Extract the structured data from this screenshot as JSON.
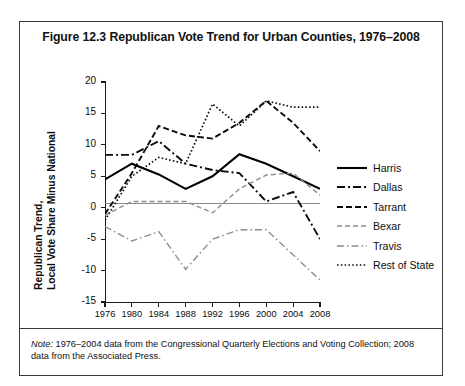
{
  "figure": {
    "title": "Figure 12.3  Republican Vote Trend for Urban Counties, 1976–2008",
    "note_prefix": "Note:",
    "note_text": " 1976–2004 data from the Congressional Quarterly Elections and Voting Collection; 2008 data from the Associated Press."
  },
  "chart_data": {
    "type": "line",
    "title": "Figure 12.3  Republican Vote Trend for Urban Counties, 1976–2008",
    "xlabel": "",
    "ylabel": "Republican Trend, Local Vote Share Minus National",
    "ylabel_line1": "Republican Trend,",
    "ylabel_line2": "Local Vote Share Minus National",
    "x": [
      1976,
      1980,
      1984,
      1988,
      1992,
      1996,
      2000,
      2004,
      2008
    ],
    "xtick_labels": [
      "1976",
      "1980",
      "1984",
      "1988",
      "1992",
      "1996",
      "2000",
      "2004",
      "2008"
    ],
    "ytick_labels": [
      "20",
      "15",
      "10",
      "5",
      "0",
      "-5",
      "-10",
      "-15"
    ],
    "yticks": [
      20,
      15,
      10,
      5,
      0,
      -5,
      -10,
      -15
    ],
    "ylim": [
      -15,
      20
    ],
    "xlim": [
      1976,
      2008
    ],
    "grid": false,
    "zero_line": true,
    "legend_position": "right",
    "series": [
      {
        "name": "Harris",
        "style": "solid",
        "color": "#000000",
        "values": [
          4.5,
          7.0,
          5.3,
          3.0,
          5.0,
          8.5,
          7.0,
          5.0,
          3.0
        ]
      },
      {
        "name": "Dallas",
        "style": "dash-dot",
        "color": "#000000",
        "values": [
          8.4,
          8.4,
          10.6,
          7.0,
          6.0,
          5.5,
          1.0,
          2.5,
          -5.0
        ]
      },
      {
        "name": "Tarrant",
        "style": "dashed",
        "color": "#000000",
        "values": [
          -1.0,
          5.5,
          13.0,
          11.5,
          11.0,
          13.5,
          17.0,
          13.5,
          9.0
        ]
      },
      {
        "name": "Bexar",
        "style": "dashed-light",
        "color": "#808080",
        "values": [
          -1.2,
          1.0,
          1.0,
          1.0,
          -0.8,
          3.0,
          5.2,
          5.5,
          2.0
        ]
      },
      {
        "name": "Travis",
        "style": "dash-dot-light",
        "color": "#808080",
        "values": [
          -3.0,
          -5.3,
          -3.8,
          -9.8,
          -5.0,
          -3.5,
          -3.5,
          -7.5,
          -11.5
        ]
      },
      {
        "name": "Rest of State",
        "style": "dotted",
        "color": "#000000",
        "values": [
          -2.0,
          5.0,
          8.0,
          7.0,
          16.5,
          13.0,
          17.0,
          16.0,
          16.0
        ]
      }
    ]
  }
}
